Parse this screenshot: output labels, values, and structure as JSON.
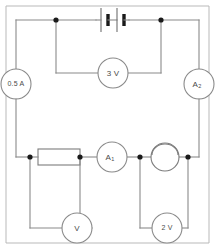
{
  "figure": {
    "name": "electric-circuit-diagram",
    "type": "circuit-schematic",
    "width": 215,
    "height": 249,
    "background_color": "#ffffff",
    "wire_color": "#8a8a8a",
    "node_color": "#1a1a1a",
    "frame_color": "#b9b9b9"
  },
  "components": {
    "battery": {
      "name": "battery-two-cells",
      "cells": 2,
      "label": ""
    },
    "voltmeter_battery": {
      "name": "voltmeter-across-battery",
      "label": "3 V",
      "value": "3",
      "unit": "V"
    },
    "ammeter_left": {
      "name": "ammeter-left",
      "label": "0.5 A",
      "value": "0.5",
      "unit": "A"
    },
    "ammeter_right": {
      "name": "ammeter-a2",
      "label_main": "A",
      "label_sub": "2"
    },
    "ammeter_middle": {
      "name": "ammeter-a1",
      "label_main": "A",
      "label_sub": "1"
    },
    "resistor": {
      "name": "resistor",
      "label": ""
    },
    "lamp": {
      "name": "lamp",
      "label": ""
    },
    "voltmeter_resistor": {
      "name": "voltmeter-across-resistor",
      "label": "V",
      "value": "",
      "unit": "V"
    },
    "voltmeter_lamp": {
      "name": "voltmeter-across-lamp",
      "label": "2 V",
      "value": "2",
      "unit": "V"
    }
  }
}
